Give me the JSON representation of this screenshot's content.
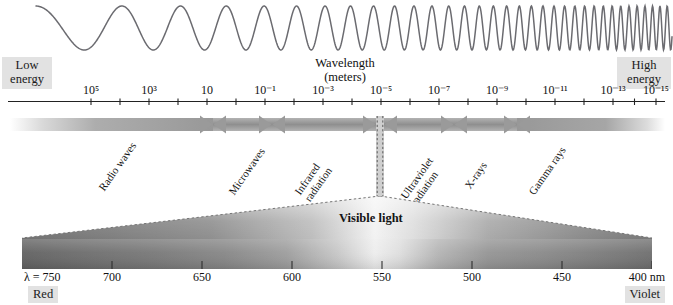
{
  "figure": {
    "wavelength_caption_line1": "Wavelength",
    "wavelength_caption_line2": "(meters)",
    "low_energy_line1": "Low",
    "low_energy_line2": "energy",
    "high_energy_line1": "High",
    "high_energy_line2": "energy",
    "visible_light_label": "Visible light"
  },
  "chart_data": {
    "type": "diagram-scale",
    "xlabel": "Wavelength (meters)",
    "axis_tick_labels": [
      {
        "base": "10",
        "exp": "5",
        "text": "10⁵",
        "x_px": 91
      },
      {
        "base": "10",
        "exp": "3",
        "text": "10³",
        "x_px": 149
      },
      {
        "base": "10",
        "exp": "",
        "text": "10",
        "x_px": 207
      },
      {
        "base": "10",
        "exp": "-1",
        "text": "10⁻¹",
        "x_px": 265
      },
      {
        "base": "10",
        "exp": "-3",
        "text": "10⁻³",
        "x_px": 323
      },
      {
        "base": "10",
        "exp": "-5",
        "text": "10⁻⁵",
        "x_px": 381
      },
      {
        "base": "10",
        "exp": "-7",
        "text": "10⁻⁷",
        "x_px": 439
      },
      {
        "base": "10",
        "exp": "-9",
        "text": "10⁻⁹",
        "x_px": 497
      },
      {
        "base": "10",
        "exp": "-11",
        "text": "10⁻¹¹",
        "x_px": 555
      },
      {
        "base": "10",
        "exp": "-13",
        "text": "10⁻¹³",
        "x_px": 613
      },
      {
        "base": "10",
        "exp": "-15",
        "text": "10⁻¹⁵",
        "x_px": 656
      }
    ],
    "bands": [
      {
        "name": "Radio waves",
        "label": "Radio waves",
        "x_start_px": 10,
        "x_end_px": 213
      },
      {
        "name": "Microwaves",
        "label": "Microwaves",
        "x_start_px": 213,
        "x_end_px": 272
      },
      {
        "name": "Infrared radiation",
        "label": "Infrared\nradiation",
        "x_start_px": 272,
        "x_end_px": 376
      },
      {
        "name": "Visible light",
        "label": "Visible light",
        "x_start_px": 376,
        "x_end_px": 384
      },
      {
        "name": "Ultraviolet radiation",
        "label": "Ultraviolet\nradiation",
        "x_start_px": 384,
        "x_end_px": 454
      },
      {
        "name": "X-rays",
        "label": "X-rays",
        "x_start_px": 454,
        "x_end_px": 517
      },
      {
        "name": "Gamma rays",
        "label": "Gamma rays",
        "x_start_px": 517,
        "x_end_px": 665
      }
    ],
    "band_labels": [
      {
        "line1": "Radio waves",
        "line2": ""
      },
      {
        "line1": "Microwaves",
        "line2": ""
      },
      {
        "line1": "Infrared",
        "line2": "radiation"
      },
      {
        "line1": "Ultraviolet",
        "line2": "radiation"
      },
      {
        "line1": "X-rays",
        "line2": ""
      },
      {
        "line1": "Gamma rays",
        "line2": ""
      }
    ],
    "visible_scale": {
      "unit": "nm",
      "symbol": "λ",
      "first_label": "λ = 750",
      "last_label": "400 nm",
      "values": [
        750,
        700,
        650,
        600,
        550,
        500,
        450,
        400
      ],
      "tick_labels": [
        "750",
        "700",
        "650",
        "600",
        "550",
        "500",
        "450",
        "400"
      ],
      "left_color_name": "Red",
      "right_color_name": "Violet",
      "range_nm": [
        400,
        750
      ]
    },
    "grid": false,
    "legend": "none"
  },
  "colors": {
    "band_gray": "#9a9a9a",
    "tag_background": "#e2e2e2",
    "axis_line": "#222222",
    "wave_stroke": "#6b6b70",
    "text": "#111111"
  }
}
